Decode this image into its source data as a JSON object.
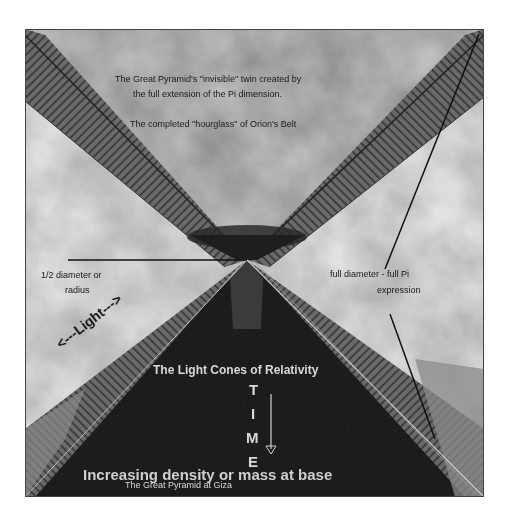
{
  "diagram": {
    "colors": {
      "page_bg": "#ffffff",
      "sky_light": "#d9d9d9",
      "sky_mid": "#a8a8a8",
      "upper_cone": "#8f8f8f",
      "band": "#5a5a5a",
      "lower_pyramid": "#151515",
      "label_dark": "#1a1a1a",
      "label_light": "#d8d8d8"
    },
    "labels": {
      "upper_line1": "The Great Pyramid's \"invisible\" twin created by",
      "upper_line2": "the full extension of the Pi dimension.",
      "upper_line3": "The completed \"hourglass\" of Orion's Belt",
      "left_radius_line1": "1/2 diameter or",
      "left_radius_line2": "radius",
      "right_diameter_line1": "full diameter - full Pi",
      "right_diameter_line2": "expression",
      "light_arrow": "<---Light--->",
      "light_cones": "The Light Cones of Relativity",
      "time_letters": [
        "T",
        "I",
        "M",
        "E"
      ],
      "great_pyramid": "The Great Pyramid at Giza",
      "bottom_caption": "Increasing density or mass at base"
    },
    "icons": {
      "time_arrow": "down-arrow"
    }
  }
}
